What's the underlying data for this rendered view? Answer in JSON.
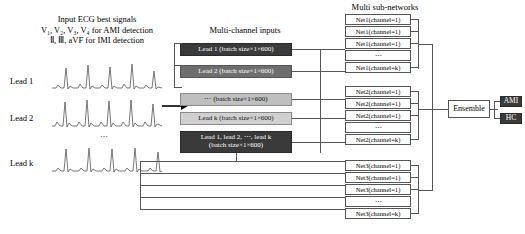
{
  "left_panel": {
    "title_line1": "Input ECG best signals",
    "title_line2": "V₁, V₂, V₃, V₄ for AMI detection",
    "title_line3": "Ⅱ, Ⅲ, aVF for IMI detection",
    "leads": [
      {
        "label": "Lead 1"
      },
      {
        "label": "Lead 2"
      },
      {
        "label": "Lead k"
      }
    ],
    "vertical_dots": "⋯"
  },
  "middle_panel": {
    "title": "Multi-channel inputs",
    "boxes": [
      {
        "label": "Lead 1 (batch size×1×600)",
        "style": "dark"
      },
      {
        "label": "Lead 2 (batch size×1×600)",
        "style": "mid"
      },
      {
        "label": "⋯ (batch size×1×600)",
        "style": "light"
      },
      {
        "label": "Lead k (batch size×1×600)",
        "style": "lighter"
      },
      {
        "label_line1": "Lead 1, lead 2, ⋯, lead k",
        "label_line2": "(batch size×1×600)",
        "style": "dark"
      }
    ]
  },
  "right_panel": {
    "title": "Multi sub-networks",
    "groups": [
      {
        "name": "net1",
        "rows": [
          {
            "label": "Net1(channel=1)"
          },
          {
            "label": "Net1(channel=1)"
          },
          {
            "label": "Net1(channel=1)"
          },
          {
            "label": "⋯"
          },
          {
            "label": "Net1(channel=k)"
          }
        ]
      },
      {
        "name": "net2",
        "rows": [
          {
            "label": "Net2(channel=1)"
          },
          {
            "label": "Net2(channel=1)"
          },
          {
            "label": "Net2(channel=1)"
          },
          {
            "label": "⋯"
          },
          {
            "label": "Net2(channel=k)"
          }
        ]
      },
      {
        "name": "net3",
        "rows": [
          {
            "label": "Net3(channel=1)"
          },
          {
            "label": "Net3(channel=1)"
          },
          {
            "label": "Net3(channel=1)"
          },
          {
            "label": "⋯"
          },
          {
            "label": "Net3(channel=k)"
          }
        ]
      }
    ]
  },
  "ensemble": {
    "label": "Ensemble"
  },
  "outputs": [
    {
      "label": "AMI",
      "color": "#3a3a3a"
    },
    {
      "label": "HC",
      "color": "#3a3a3a"
    }
  ]
}
